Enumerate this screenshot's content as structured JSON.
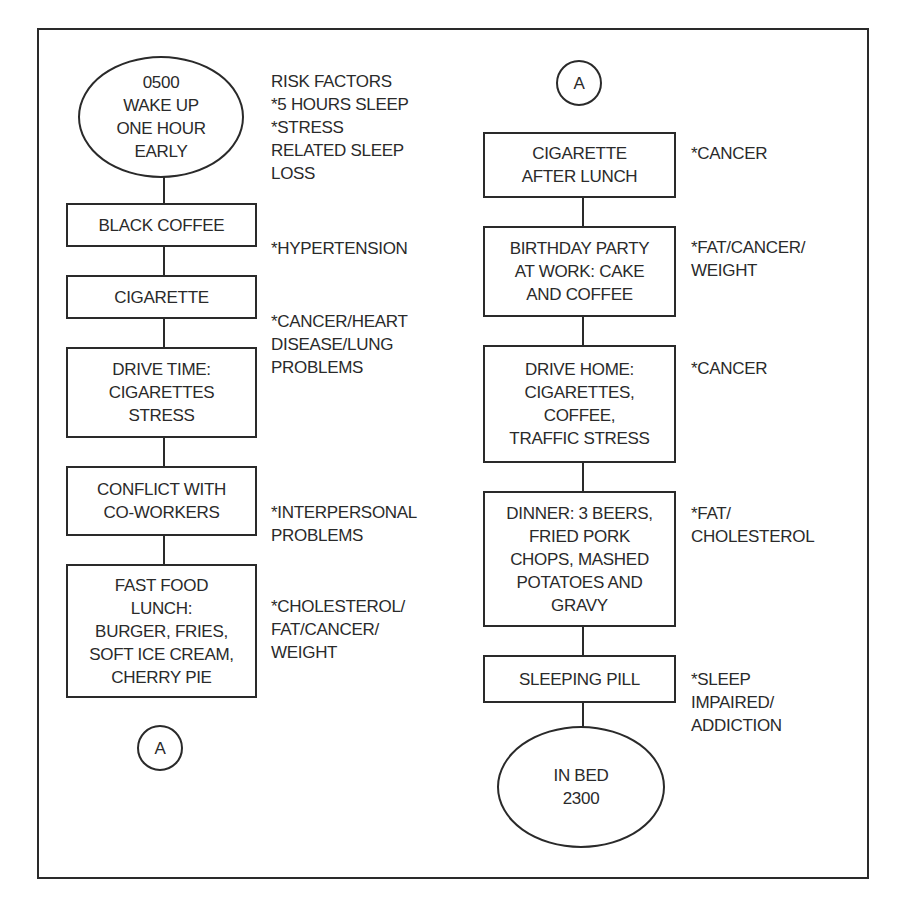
{
  "diagram": {
    "left_column": {
      "start": {
        "label": "0500\nWAKE UP\nONE HOUR\nEARLY"
      },
      "steps": [
        {
          "label": "BLACK COFFEE"
        },
        {
          "label": "CIGARETTE"
        },
        {
          "label": "DRIVE TIME:\nCIGARETTES\nSTRESS"
        },
        {
          "label": "CONFLICT WITH\nCO-WORKERS"
        },
        {
          "label": "FAST FOOD\nLUNCH:\nBURGER, FRIES,\nSOFT ICE CREAM,\nCHERRY PIE"
        }
      ],
      "connector": {
        "label": "A"
      },
      "notes": [
        {
          "label": "RISK FACTORS\n*5 HOURS SLEEP\n*STRESS\nRELATED SLEEP\nLOSS"
        },
        {
          "label": "*HYPERTENSION"
        },
        {
          "label": "*CANCER/HEART\nDISEASE/LUNG\nPROBLEMS"
        },
        {
          "label": "*INTERPERSONAL\nPROBLEMS"
        },
        {
          "label": "*CHOLESTEROL/\nFAT/CANCER/\nWEIGHT"
        }
      ]
    },
    "right_column": {
      "connector": {
        "label": "A"
      },
      "steps": [
        {
          "label": "CIGARETTE\nAFTER LUNCH"
        },
        {
          "label": "BIRTHDAY PARTY\nAT WORK: CAKE\nAND COFFEE"
        },
        {
          "label": "DRIVE HOME:\nCIGARETTES,\nCOFFEE,\nTRAFFIC STRESS"
        },
        {
          "label": "DINNER: 3 BEERS,\nFRIED PORK\nCHOPS, MASHED\nPOTATOES AND\nGRAVY"
        },
        {
          "label": "SLEEPING PILL"
        }
      ],
      "end": {
        "label": "IN BED\n2300"
      },
      "notes": [
        {
          "label": "*CANCER"
        },
        {
          "label": "*FAT/CANCER/\nWEIGHT"
        },
        {
          "label": "*CANCER"
        },
        {
          "label": "*FAT/\nCHOLESTEROL"
        },
        {
          "label": "*SLEEP\nIMPAIRED/\nADDICTION"
        }
      ]
    },
    "colors": {
      "line": "#2a2a2a",
      "background": "#ffffff"
    }
  }
}
